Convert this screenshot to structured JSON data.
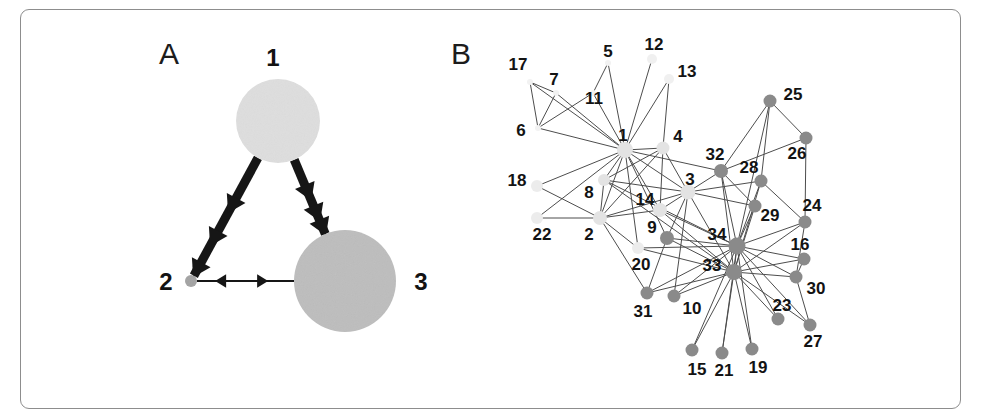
{
  "figure": {
    "panels": [
      {
        "id": "A",
        "letter": "A",
        "letter_x": 159,
        "letter_y": 39
      },
      {
        "id": "B",
        "letter": "B",
        "letter_x": 451,
        "letter_y": 39
      }
    ],
    "frame": {
      "x": 20,
      "y": 9,
      "width": 941,
      "height": 400,
      "stroke": "#8d8d8d"
    },
    "background": "#ffffff"
  },
  "chart_data": [
    {
      "type": "diagram",
      "subtype": "directed-weighted-graph",
      "panel": "A",
      "title": "",
      "description": "Three-node directed graph with node sizes proportional to a value and edge thickness proportional to weight.",
      "nodes": [
        {
          "id": "1",
          "label": "1",
          "x": 278,
          "y": 121,
          "r": 42,
          "color": "#dedede",
          "label_x": 273,
          "label_y": 66,
          "label_anchor": "middle"
        },
        {
          "id": "2",
          "label": "2",
          "x": 191,
          "y": 281,
          "r": 6,
          "color": "#a3a3a3",
          "label_x": 166,
          "label_y": 290,
          "label_anchor": "middle"
        },
        {
          "id": "3",
          "label": "3",
          "x": 345,
          "y": 281,
          "r": 51,
          "color": "#bdbdbd",
          "label_x": 421,
          "label_y": 290,
          "label_anchor": "middle"
        }
      ],
      "edges": [
        {
          "source": "1",
          "target": "2",
          "weight": "thick",
          "width": 9,
          "directed": true,
          "bidirectional": false,
          "color": "#161616"
        },
        {
          "source": "1",
          "target": "3",
          "weight": "thick",
          "width": 9,
          "directed": true,
          "bidirectional": false,
          "color": "#161616"
        },
        {
          "source": "2",
          "target": "3",
          "weight": "thin",
          "width": 2,
          "directed": true,
          "bidirectional": true,
          "color": "#161616"
        }
      ],
      "edge_note": "Edges 1->2 and 1->3 are heavy with double chevron arrowheads; edge 2<->3 is thin and bidirectional."
    },
    {
      "type": "diagram",
      "subtype": "undirected-graph",
      "panel": "B",
      "title": "",
      "description": "Zachary karate club style social network with 34 labelled nodes in two shaded communities (light and dark).",
      "node_count": 34,
      "communities": [
        {
          "name": "light",
          "color": "#e3e3e3",
          "members": [
            "1",
            "2",
            "3",
            "4",
            "5",
            "6",
            "7",
            "8",
            "11",
            "12",
            "13",
            "14",
            "17",
            "18",
            "20",
            "22"
          ]
        },
        {
          "name": "dark",
          "color": "#8a8a8a",
          "members": [
            "9",
            "10",
            "15",
            "16",
            "19",
            "21",
            "23",
            "24",
            "25",
            "26",
            "27",
            "28",
            "29",
            "30",
            "31",
            "32",
            "33",
            "34"
          ]
        }
      ],
      "nodes": [
        {
          "id": "1",
          "label": "1",
          "x": 625,
          "y": 150,
          "r": 8,
          "color": "#e3e3e3",
          "label_x": 623,
          "label_y": 141,
          "label_anchor": "middle"
        },
        {
          "id": "2",
          "label": "2",
          "x": 600,
          "y": 218,
          "r": 7,
          "color": "#e3e3e3",
          "label_x": 589,
          "label_y": 240,
          "label_anchor": "middle"
        },
        {
          "id": "3",
          "label": "3",
          "x": 688,
          "y": 192,
          "r": 7.5,
          "color": "#e3e3e3",
          "label_x": 690,
          "label_y": 185,
          "label_anchor": "middle"
        },
        {
          "id": "4",
          "label": "4",
          "x": 663,
          "y": 148,
          "r": 6.5,
          "color": "#e3e3e3",
          "label_x": 678,
          "label_y": 142,
          "label_anchor": "middle"
        },
        {
          "id": "5",
          "label": "5",
          "x": 608,
          "y": 63,
          "r": 3,
          "color": "#f2f2f2",
          "label_x": 608,
          "label_y": 57,
          "label_anchor": "middle"
        },
        {
          "id": "6",
          "label": "6",
          "x": 538,
          "y": 128,
          "r": 3,
          "color": "#f2f2f2",
          "label_x": 521,
          "label_y": 136,
          "label_anchor": "middle"
        },
        {
          "id": "7",
          "label": "7",
          "x": 556,
          "y": 93,
          "r": 3,
          "color": "#f2f2f2",
          "label_x": 554,
          "label_y": 85,
          "label_anchor": "middle"
        },
        {
          "id": "8",
          "label": "8",
          "x": 604,
          "y": 180,
          "r": 6,
          "color": "#e3e3e3",
          "label_x": 589,
          "label_y": 198,
          "label_anchor": "middle"
        },
        {
          "id": "9",
          "label": "9",
          "x": 667,
          "y": 238,
          "r": 7,
          "color": "#8a8a8a",
          "label_x": 652,
          "label_y": 233,
          "label_anchor": "middle"
        },
        {
          "id": "10",
          "label": "10",
          "x": 674,
          "y": 296,
          "r": 6.5,
          "color": "#8a8a8a",
          "label_x": 692,
          "label_y": 314,
          "label_anchor": "middle"
        },
        {
          "id": "11",
          "label": "11",
          "x": 593,
          "y": 93,
          "r": 3,
          "color": "#f2f2f2",
          "label_x": 594,
          "label_y": 104,
          "label_anchor": "middle"
        },
        {
          "id": "12",
          "label": "12",
          "x": 652,
          "y": 59,
          "r": 5,
          "color": "#f0f0f0",
          "label_x": 654,
          "label_y": 50,
          "label_anchor": "middle"
        },
        {
          "id": "13",
          "label": "13",
          "x": 669,
          "y": 79,
          "r": 5,
          "color": "#f0f0f0",
          "label_x": 687,
          "label_y": 77,
          "label_anchor": "middle"
        },
        {
          "id": "14",
          "label": "14",
          "x": 660,
          "y": 210,
          "r": 7,
          "color": "#e3e3e3",
          "label_x": 645,
          "label_y": 205,
          "label_anchor": "middle"
        },
        {
          "id": "15",
          "label": "15",
          "x": 692,
          "y": 350,
          "r": 6.5,
          "color": "#8a8a8a",
          "label_x": 697,
          "label_y": 375,
          "label_anchor": "middle"
        },
        {
          "id": "16",
          "label": "16",
          "x": 804,
          "y": 259,
          "r": 6.5,
          "color": "#8a8a8a",
          "label_x": 800,
          "label_y": 250,
          "label_anchor": "middle"
        },
        {
          "id": "17",
          "label": "17",
          "x": 530,
          "y": 82,
          "r": 3,
          "color": "#f2f2f2",
          "label_x": 518,
          "label_y": 70,
          "label_anchor": "middle"
        },
        {
          "id": "18",
          "label": "18",
          "x": 537,
          "y": 186,
          "r": 6,
          "color": "#ececec",
          "label_x": 517,
          "label_y": 186,
          "label_anchor": "middle"
        },
        {
          "id": "19",
          "label": "19",
          "x": 752,
          "y": 349,
          "r": 6.5,
          "color": "#8a8a8a",
          "label_x": 758,
          "label_y": 373,
          "label_anchor": "middle"
        },
        {
          "id": "20",
          "label": "20",
          "x": 638,
          "y": 248,
          "r": 6,
          "color": "#ececec",
          "label_x": 641,
          "label_y": 270,
          "label_anchor": "middle"
        },
        {
          "id": "21",
          "label": "21",
          "x": 722,
          "y": 353,
          "r": 6.5,
          "color": "#8a8a8a",
          "label_x": 724,
          "label_y": 376,
          "label_anchor": "middle"
        },
        {
          "id": "22",
          "label": "22",
          "x": 537,
          "y": 218,
          "r": 6,
          "color": "#ececec",
          "label_x": 542,
          "label_y": 240,
          "label_anchor": "middle"
        },
        {
          "id": "23",
          "label": "23",
          "x": 778,
          "y": 319,
          "r": 6.5,
          "color": "#8a8a8a",
          "label_x": 782,
          "label_y": 311,
          "label_anchor": "middle"
        },
        {
          "id": "24",
          "label": "24",
          "x": 805,
          "y": 222,
          "r": 6.5,
          "color": "#8a8a8a",
          "label_x": 812,
          "label_y": 211,
          "label_anchor": "middle"
        },
        {
          "id": "25",
          "label": "25",
          "x": 770,
          "y": 101,
          "r": 6.5,
          "color": "#8a8a8a",
          "label_x": 793,
          "label_y": 100,
          "label_anchor": "middle"
        },
        {
          "id": "26",
          "label": "26",
          "x": 806,
          "y": 138,
          "r": 6.5,
          "color": "#8a8a8a",
          "label_x": 797,
          "label_y": 159,
          "label_anchor": "middle"
        },
        {
          "id": "27",
          "label": "27",
          "x": 810,
          "y": 325,
          "r": 6.5,
          "color": "#8a8a8a",
          "label_x": 813,
          "label_y": 347,
          "label_anchor": "middle"
        },
        {
          "id": "28",
          "label": "28",
          "x": 761,
          "y": 181,
          "r": 6.5,
          "color": "#8a8a8a",
          "label_x": 749,
          "label_y": 173,
          "label_anchor": "middle"
        },
        {
          "id": "29",
          "label": "29",
          "x": 755,
          "y": 206,
          "r": 6.5,
          "color": "#8a8a8a",
          "label_x": 770,
          "label_y": 221,
          "label_anchor": "middle"
        },
        {
          "id": "30",
          "label": "30",
          "x": 796,
          "y": 277,
          "r": 6.5,
          "color": "#8a8a8a",
          "label_x": 816,
          "label_y": 294,
          "label_anchor": "middle"
        },
        {
          "id": "31",
          "label": "31",
          "x": 647,
          "y": 293,
          "r": 6.5,
          "color": "#8a8a8a",
          "label_x": 643,
          "label_y": 317,
          "label_anchor": "middle"
        },
        {
          "id": "32",
          "label": "32",
          "x": 721,
          "y": 171,
          "r": 7,
          "color": "#8a8a8a",
          "label_x": 715,
          "label_y": 160,
          "label_anchor": "middle"
        },
        {
          "id": "33",
          "label": "33",
          "x": 734,
          "y": 272,
          "r": 8,
          "color": "#8a8a8a",
          "label_x": 712,
          "label_y": 271,
          "label_anchor": "middle"
        },
        {
          "id": "34",
          "label": "34",
          "x": 737,
          "y": 246,
          "r": 8.5,
          "color": "#8a8a8a",
          "label_x": 717,
          "label_y": 240,
          "label_anchor": "middle"
        }
      ],
      "edges": [
        [
          "1",
          "2"
        ],
        [
          "1",
          "3"
        ],
        [
          "1",
          "4"
        ],
        [
          "1",
          "5"
        ],
        [
          "1",
          "6"
        ],
        [
          "1",
          "7"
        ],
        [
          "1",
          "8"
        ],
        [
          "1",
          "9"
        ],
        [
          "1",
          "11"
        ],
        [
          "1",
          "12"
        ],
        [
          "1",
          "13"
        ],
        [
          "1",
          "14"
        ],
        [
          "1",
          "18"
        ],
        [
          "1",
          "20"
        ],
        [
          "1",
          "22"
        ],
        [
          "1",
          "32"
        ],
        [
          "2",
          "3"
        ],
        [
          "2",
          "4"
        ],
        [
          "2",
          "8"
        ],
        [
          "2",
          "14"
        ],
        [
          "2",
          "18"
        ],
        [
          "2",
          "20"
        ],
        [
          "2",
          "22"
        ],
        [
          "2",
          "31"
        ],
        [
          "3",
          "4"
        ],
        [
          "3",
          "8"
        ],
        [
          "3",
          "9"
        ],
        [
          "3",
          "10"
        ],
        [
          "3",
          "14"
        ],
        [
          "3",
          "28"
        ],
        [
          "3",
          "29"
        ],
        [
          "3",
          "33"
        ],
        [
          "4",
          "8"
        ],
        [
          "4",
          "13"
        ],
        [
          "4",
          "14"
        ],
        [
          "5",
          "11"
        ],
        [
          "6",
          "7"
        ],
        [
          "6",
          "11"
        ],
        [
          "6",
          "17"
        ],
        [
          "7",
          "17"
        ],
        [
          "9",
          "31"
        ],
        [
          "9",
          "33"
        ],
        [
          "9",
          "34"
        ],
        [
          "10",
          "34"
        ],
        [
          "14",
          "34"
        ],
        [
          "15",
          "33"
        ],
        [
          "15",
          "34"
        ],
        [
          "16",
          "33"
        ],
        [
          "16",
          "34"
        ],
        [
          "19",
          "33"
        ],
        [
          "19",
          "34"
        ],
        [
          "20",
          "34"
        ],
        [
          "21",
          "33"
        ],
        [
          "21",
          "34"
        ],
        [
          "23",
          "33"
        ],
        [
          "23",
          "34"
        ],
        [
          "24",
          "26"
        ],
        [
          "24",
          "28"
        ],
        [
          "24",
          "30"
        ],
        [
          "24",
          "33"
        ],
        [
          "24",
          "34"
        ],
        [
          "25",
          "26"
        ],
        [
          "25",
          "28"
        ],
        [
          "25",
          "32"
        ],
        [
          "26",
          "24"
        ],
        [
          "26",
          "32"
        ],
        [
          "27",
          "30"
        ],
        [
          "27",
          "34"
        ],
        [
          "28",
          "34"
        ],
        [
          "29",
          "32"
        ],
        [
          "29",
          "34"
        ],
        [
          "30",
          "33"
        ],
        [
          "30",
          "34"
        ],
        [
          "31",
          "33"
        ],
        [
          "31",
          "34"
        ],
        [
          "32",
          "33"
        ],
        [
          "32",
          "34"
        ],
        [
          "33",
          "34"
        ],
        [
          "6",
          "1"
        ],
        [
          "7",
          "1"
        ],
        [
          "17",
          "1"
        ],
        [
          "5",
          "1"
        ],
        [
          "11",
          "1"
        ],
        [
          "12",
          "1"
        ],
        [
          "13",
          "1"
        ],
        [
          "18",
          "2"
        ],
        [
          "22",
          "2"
        ],
        [
          "8",
          "33"
        ],
        [
          "8",
          "34"
        ],
        [
          "10",
          "33"
        ],
        [
          "14",
          "33"
        ],
        [
          "3",
          "32"
        ],
        [
          "29",
          "33"
        ],
        [
          "28",
          "33"
        ],
        [
          "27",
          "33"
        ],
        [
          "16",
          "30"
        ],
        [
          "34",
          "25"
        ],
        [
          "33",
          "20"
        ]
      ],
      "edge_color": "#4d4d4d",
      "edge_width": 1,
      "legend": null,
      "grid": false
    }
  ]
}
